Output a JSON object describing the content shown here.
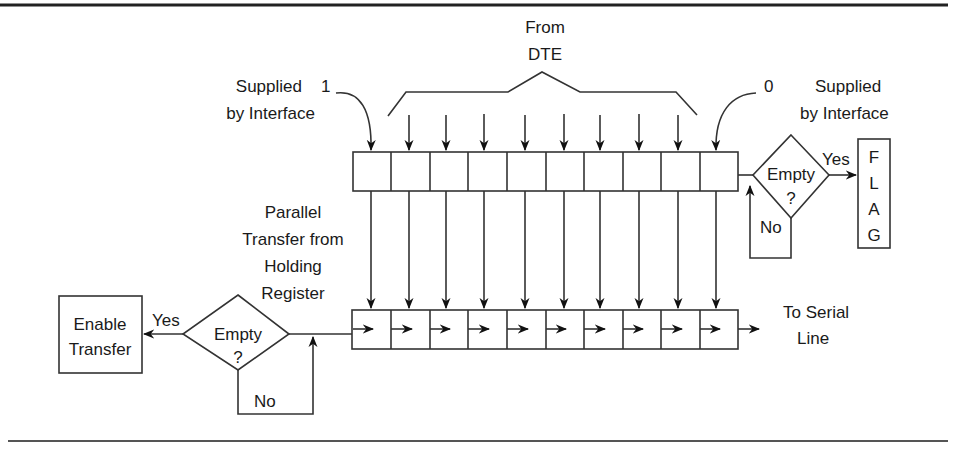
{
  "diagram": {
    "top_labels": {
      "from_dte": [
        "From",
        "DTE"
      ],
      "supplied_left": [
        "Supplied",
        "by Interface"
      ],
      "supplied_left_bit": "1",
      "supplied_right": [
        "Supplied",
        "by Interface"
      ],
      "supplied_right_bit": "0"
    },
    "holding_register": {
      "cells": 10
    },
    "transmit_register": {
      "cells": 10
    },
    "parallel_transfer_label": [
      "Parallel",
      "Transfer from",
      "Holding",
      "Register"
    ],
    "right_decision": {
      "label": [
        "Empty",
        "?"
      ],
      "yes": "Yes",
      "no": "No",
      "flag_letters": [
        "F",
        "L",
        "A",
        "G"
      ]
    },
    "left_decision": {
      "label": [
        "Empty",
        "?"
      ],
      "yes": "Yes",
      "no": "No",
      "enable_box": [
        "Enable",
        "Transfer"
      ]
    },
    "serial_line_label": [
      "To Serial",
      "Line"
    ],
    "colors": {
      "line": "#333333",
      "text": "#1a1a1a",
      "background": "#ffffff"
    }
  }
}
